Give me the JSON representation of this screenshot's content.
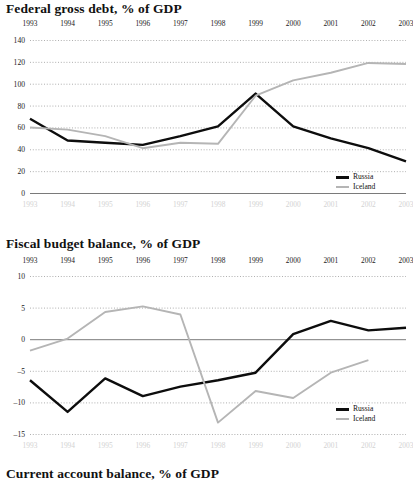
{
  "page": {
    "background": "#ffffff",
    "series_colors": {
      "russia": "#0d0d0d",
      "iceland": "#b5b5b5"
    }
  },
  "charts": [
    {
      "id": "federal-gross-debt",
      "title": "Federal gross debt, % of GDP",
      "legend": [
        {
          "name": "Russia"
        },
        {
          "name": "Iceland"
        }
      ],
      "chart_data": {
        "type": "line",
        "title": "Federal gross debt, % of GDP",
        "xlabel": "",
        "ylabel": "% of GDP",
        "x": [
          "1993",
          "1994",
          "1995",
          "1996",
          "1997",
          "1998",
          "1999",
          "2000",
          "2001",
          "2002",
          "2003"
        ],
        "categories": [
          "1993",
          "1994",
          "1995",
          "1996",
          "1997",
          "1998",
          "1999",
          "2000",
          "2001",
          "2002",
          "2003"
        ],
        "yticks": [
          0,
          20,
          40,
          60,
          80,
          100,
          120,
          140
        ],
        "ylim": [
          0,
          140
        ],
        "grid": true,
        "legend_position": "bottom-right",
        "series": [
          {
            "name": "Russia",
            "color": "#0d0d0d",
            "values": [
              68,
              48,
              46,
              44,
              52,
              61,
              91,
              61,
              50,
              41,
              29
            ]
          },
          {
            "name": "Iceland",
            "color": "#b5b5b5",
            "values": [
              60,
              58,
              52,
              41,
              46,
              45,
              89,
              103,
              110,
              119,
              118
            ]
          }
        ]
      }
    },
    {
      "id": "fiscal-budget-balance",
      "title": "Fiscal budget balance, % of GDP",
      "legend": [
        {
          "name": "Russia"
        },
        {
          "name": "Iceland"
        }
      ],
      "chart_data": {
        "type": "line",
        "title": "Fiscal budget balance, % of GDP",
        "xlabel": "",
        "ylabel": "% of GDP",
        "x": [
          "1993",
          "1994",
          "1995",
          "1996",
          "1997",
          "1998",
          "1999",
          "2000",
          "2001",
          "2002",
          "2003"
        ],
        "categories": [
          "1993",
          "1994",
          "1995",
          "1996",
          "1997",
          "1998",
          "1999",
          "2000",
          "2001",
          "2002",
          "2003"
        ],
        "yticks": [
          -15,
          -10,
          -5,
          0,
          5,
          10
        ],
        "ylim": [
          -15,
          10
        ],
        "grid": true,
        "legend_position": "bottom-right",
        "series": [
          {
            "name": "Russia",
            "color": "#0d0d0d",
            "values": [
              -6.5,
              -11.5,
              -6.2,
              -9.0,
              -7.5,
              -6.5,
              -5.3,
              0.8,
              2.9,
              1.4,
              1.8
            ]
          },
          {
            "name": "Iceland",
            "color": "#b5b5b5",
            "values": [
              -1.8,
              0.1,
              4.3,
              5.2,
              3.9,
              -13.2,
              -8.2,
              -9.3,
              -5.3,
              -3.3,
              null
            ]
          }
        ]
      }
    },
    {
      "id": "current-account-balance",
      "title": "Current account balance, % of GDP",
      "legend": [],
      "chart_data": {
        "type": "line",
        "title": "Current account balance, % of GDP",
        "x": [],
        "categories": [],
        "series": []
      }
    }
  ]
}
